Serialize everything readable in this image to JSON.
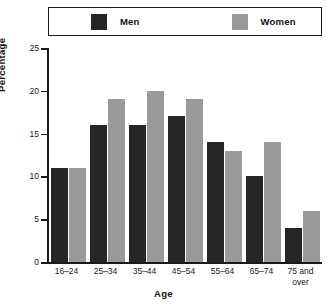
{
  "chart_data": {
    "type": "bar",
    "title": "",
    "xlabel": "Age",
    "ylabel": "Percentage",
    "categories": [
      "16–24",
      "25–34",
      "35–44",
      "45–54",
      "55–64",
      "65–74",
      "75 and over"
    ],
    "series": [
      {
        "name": "Men",
        "color": "#262626",
        "values": [
          11,
          16,
          16,
          17,
          14,
          10,
          4
        ]
      },
      {
        "name": "Women",
        "color": "#9a9a9a",
        "values": [
          11,
          19,
          20,
          19,
          13,
          14,
          6
        ]
      }
    ],
    "ylim": [
      0,
      25
    ],
    "ytick_labels": [
      "0",
      "5",
      "10",
      "15",
      "20",
      "25"
    ],
    "ytick_values": [
      0,
      5,
      10,
      15,
      20,
      25
    ],
    "grid": false,
    "legend_position": "top"
  },
  "legend": {
    "entries": [
      {
        "label": "Men",
        "swatch": "legend-swatch-men"
      },
      {
        "label": "Women",
        "swatch": "legend-swatch-women"
      }
    ]
  },
  "colors": {
    "men": "#262626",
    "women": "#9a9a9a",
    "axis": "#1a1a1a",
    "background": "#ffffff"
  }
}
